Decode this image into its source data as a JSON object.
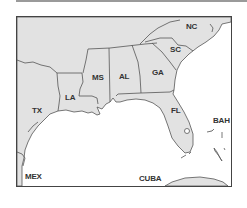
{
  "map": {
    "title": "Southeastern United States",
    "colors": {
      "land": "#e2e2e2",
      "water": "#ffffff",
      "border": "#555555",
      "frame": "#444444"
    },
    "labels": [
      {
        "id": "nc",
        "text": "NC",
        "x": 186,
        "y": 27
      },
      {
        "id": "sc",
        "text": "SC",
        "x": 170,
        "y": 50
      },
      {
        "id": "ga",
        "text": "GA",
        "x": 152,
        "y": 73
      },
      {
        "id": "al",
        "text": "AL",
        "x": 119,
        "y": 77
      },
      {
        "id": "ms",
        "text": "MS",
        "x": 92,
        "y": 78
      },
      {
        "id": "la",
        "text": "LA",
        "x": 65,
        "y": 98
      },
      {
        "id": "tx",
        "text": "TX",
        "x": 32,
        "y": 111
      },
      {
        "id": "fl",
        "text": "FL",
        "x": 171,
        "y": 111
      },
      {
        "id": "bah",
        "text": "BAH",
        "x": 213,
        "y": 121
      },
      {
        "id": "mex",
        "text": "MEX",
        "x": 25,
        "y": 177
      },
      {
        "id": "cuba",
        "text": "CUBA",
        "x": 139,
        "y": 179
      }
    ]
  }
}
